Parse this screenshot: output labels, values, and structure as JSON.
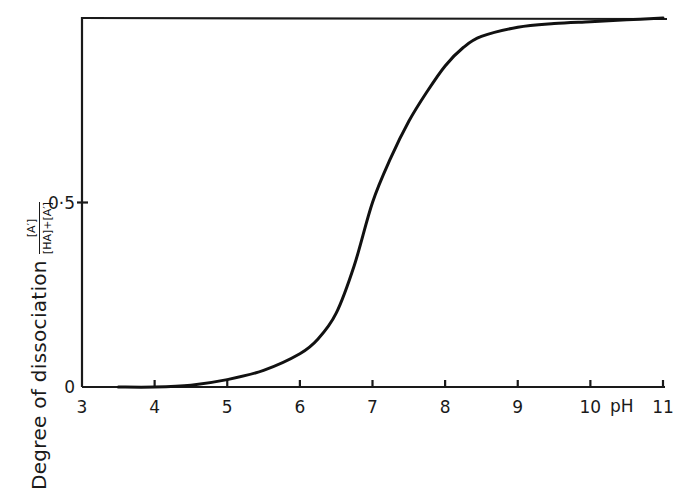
{
  "chart_data": {
    "type": "line",
    "title": "",
    "xlabel": "pH",
    "ylabel": "Degree of dissociation",
    "ylabel_fraction": {
      "numerator": "[A′]",
      "denominator": "[HA]+[A′]"
    },
    "xlim": [
      3,
      11
    ],
    "ylim": [
      0,
      1
    ],
    "x_ticks": [
      3,
      4,
      5,
      6,
      7,
      8,
      9,
      10,
      11
    ],
    "x_tick_labels": [
      "3",
      "4",
      "5",
      "6",
      "7",
      "8",
      "9",
      "10",
      "11"
    ],
    "y_ticks": [
      0,
      0.5
    ],
    "y_tick_labels": [
      "0",
      "0·5"
    ],
    "grid": false,
    "legend": null,
    "reference_line": {
      "y": 1.0,
      "description": "upper asymptote"
    },
    "series": [
      {
        "name": "degree of dissociation",
        "x": [
          3.5,
          4.0,
          4.5,
          5.0,
          5.5,
          6.0,
          6.25,
          6.5,
          6.75,
          7.0,
          7.25,
          7.5,
          7.75,
          8.0,
          8.25,
          8.5,
          9.0,
          9.5,
          10.0,
          10.5,
          11.0
        ],
        "values": [
          0.0,
          0.0,
          0.005,
          0.02,
          0.045,
          0.09,
          0.13,
          0.2,
          0.33,
          0.5,
          0.62,
          0.72,
          0.8,
          0.87,
          0.92,
          0.95,
          0.975,
          0.985,
          0.99,
          0.995,
          1.0
        ]
      }
    ]
  },
  "axes": {
    "x_unit_label": "pH",
    "y_label_main": "Degree of dissociation",
    "y_label_num": "[A′]",
    "y_label_den": "[HA]+[A′]"
  }
}
